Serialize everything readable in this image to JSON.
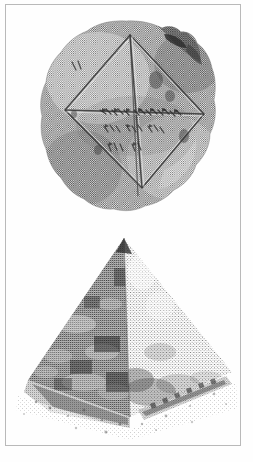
{
  "page": {
    "kind": "scanned-book-page",
    "background_color": "#fefefe",
    "frame_rule_color": "#b9b9b9",
    "width_px": 253,
    "height_px": 462
  },
  "figures": [
    {
      "id": "babylonian-tablet",
      "subject": "Babylonian clay tablet YBC 7289",
      "description": "Round clay tablet, halftone-screened photograph, inscribed with a square rotated 45 degrees and its two diagonals, with cuneiform sexagesimal numerals written along the horizontal diagonal and beneath it",
      "render_style": "halftone-dot-screen",
      "ink_color": "#5a5a5a",
      "mid_tone": "#8d8d8d",
      "light_tone": "#c3c3c3",
      "shadow_tone": "#3a3a3a",
      "bounds": {
        "x": 38,
        "y": 18,
        "w": 180,
        "h": 196
      }
    },
    {
      "id": "great-pyramid",
      "subject": "Great Pyramid at Giza",
      "description": "Dithered photograph of a pyramid seen from a corner, left face in deep shadow, right face in light, rubble field and wall at the base, blank sky",
      "render_style": "coarse-dither",
      "ink_color": "#4a4a4a",
      "mid_tone": "#8a8a8a",
      "light_tone": "#c9c9c9",
      "shadow_tone": "#2e2e2e",
      "bounds": {
        "x": 10,
        "y": 232,
        "w": 230,
        "h": 210
      }
    }
  ],
  "text": {
    "caption": "",
    "page_number": "",
    "running_head": ""
  }
}
